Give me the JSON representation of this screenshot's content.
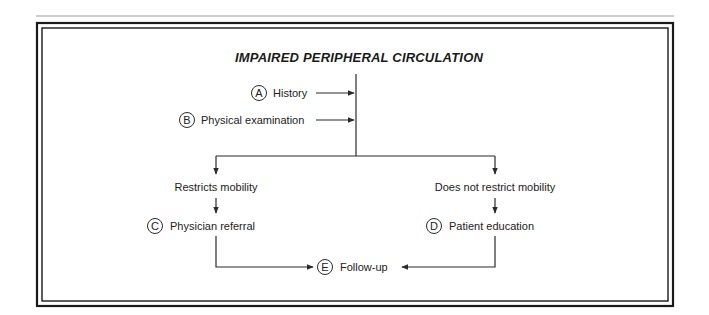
{
  "diagram": {
    "title": "IMPAIRED PERIPHERAL CIRCULATION",
    "inputs": [
      {
        "letter": "A",
        "label": "History"
      },
      {
        "letter": "B",
        "label": "Physical examination"
      }
    ],
    "branches": {
      "left": {
        "condition": "Restricts mobility",
        "action": {
          "letter": "C",
          "label": "Physician referral"
        }
      },
      "right": {
        "condition": "Does not restrict mobility",
        "action": {
          "letter": "D",
          "label": "Patient education"
        }
      }
    },
    "outcome": {
      "letter": "E",
      "label": "Follow-up"
    }
  },
  "colors": {
    "line": "#2a2a2a",
    "frame": "#1a1a1a",
    "top_rule": "#9a9a9a"
  }
}
